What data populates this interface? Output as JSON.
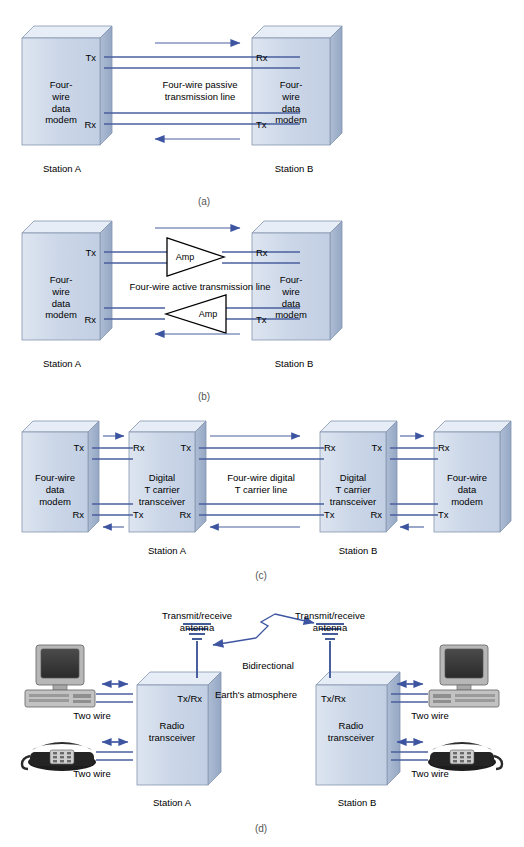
{
  "figure": {
    "line_color": "#4a5f9e",
    "box_front_color": "#ccd7e8",
    "box_top_color": "#e4ebf5",
    "box_side_color": "#9fb0cc",
    "outline_color": "#7d8ea8"
  },
  "panels": [
    {
      "id": "a",
      "caption": "(a)",
      "boxes": [
        {
          "label": "Four-\nwire\ndata\nmodem",
          "ports": [
            "Tx",
            "Rx"
          ]
        },
        {
          "label": "Four-\nwire\ndata\nmodem",
          "ports": [
            "Rx",
            "Tx"
          ]
        }
      ],
      "center_label": "Four-wire passive\ntransmission line",
      "stations": [
        "Station A",
        "Station B"
      ]
    },
    {
      "id": "b",
      "caption": "(b)",
      "boxes": [
        {
          "label": "Four-\nwire\ndata\nmodem",
          "ports": [
            "Tx",
            "Rx"
          ]
        },
        {
          "label": "Four-\nwire\ndata\nmodem",
          "ports": [
            "Rx",
            "Tx"
          ]
        }
      ],
      "center_label": "Four-wire active transmission line",
      "amplifiers": [
        "Amp",
        "Amp"
      ],
      "stations": [
        "Station A",
        "Station B"
      ]
    },
    {
      "id": "c",
      "caption": "(c)",
      "boxes": [
        {
          "label": "Four-wire\ndata\nmodem",
          "top_port": "Tx",
          "bottom_port": "Rx"
        },
        {
          "label": "Digital\nT carrier\ntransceiver",
          "top_ports": [
            "Rx",
            "Tx"
          ],
          "bottom_ports": [
            "Tx",
            "Rx"
          ]
        },
        {
          "label": "Digital\nT carrier\ntransceiver",
          "top_ports": [
            "Rx",
            "Tx"
          ],
          "bottom_ports": [
            "Tx",
            "Rx"
          ]
        },
        {
          "label": "Four-wire\ndata\nmodem",
          "top_port": "Rx",
          "bottom_port": "Tx"
        }
      ],
      "center_label": "Four-wire digital\nT carrier line",
      "stations": [
        "Station A",
        "Station B"
      ]
    },
    {
      "id": "d",
      "caption": "(d)",
      "boxes": [
        {
          "label": "Radio\ntransceiver",
          "port": "Tx/Rx"
        },
        {
          "label": "Radio\ntransceiver",
          "port": "Tx/Rx"
        }
      ],
      "antenna_labels": [
        "Transmit/receive\nantenna",
        "Transmit/receive\nantenna"
      ],
      "link_label": "Bidirectional",
      "atmosphere_label": "Earth's atmosphere",
      "wire_labels": [
        "Two wire",
        "Two wire",
        "Two wire",
        "Two wire"
      ],
      "stations": [
        "Station A",
        "Station B"
      ],
      "devices": [
        "computer-left",
        "telephone-left",
        "computer-right",
        "telephone-right"
      ]
    }
  ]
}
